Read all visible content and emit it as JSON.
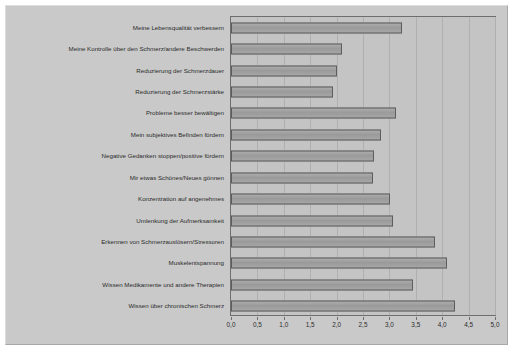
{
  "chart_data": {
    "type": "bar",
    "orientation": "horizontal",
    "title": "",
    "xlabel": "",
    "ylabel": "",
    "xlim": [
      0.0,
      5.0
    ],
    "xticks": [
      "0,0",
      "0,5",
      "1,0",
      "1,5",
      "2,0",
      "2,5",
      "3,0",
      "3,5",
      "4,0",
      "4,5",
      "5,0"
    ],
    "xtick_values": [
      0.0,
      0.5,
      1.0,
      1.5,
      2.0,
      2.5,
      3.0,
      3.5,
      4.0,
      4.5,
      5.0
    ],
    "grid": true,
    "legend": "none",
    "categories": [
      "Meine Lebensqualität verbessern",
      "Meine Kontrolle über den Schmerz/andere Beschwerden",
      "Reduzierung der Schmerzdauer",
      "Reduzierung der Schmerzstärke",
      "Probleme besser bewältigen",
      "Mein subjektives Befinden fördern",
      "Negative Gedanken stoppen/positive fördern",
      "Mir etwas Schönes/Neues gönnen",
      "Konzentration auf angenehmes",
      "Umlenkung der Aufmerksamkeit",
      "Erkennen von Schmerzauslösern/Stressoren",
      "Muskelentspannung",
      "Wissen Medikamente und andere Therapien",
      "Wissen über chronischen Schmerz"
    ],
    "values": [
      3.23,
      2.1,
      2.0,
      1.93,
      3.12,
      2.84,
      2.7,
      2.68,
      3.01,
      3.06,
      3.86,
      4.1,
      3.44,
      4.24
    ],
    "colors": {
      "bar_fill": "#a0a0a0",
      "bar_edge": "#5d5d5d",
      "plot_background": "#c4c4c4",
      "panel_background": "#c9c9c9",
      "grid": "#b0b0b0",
      "axis": "#6e6e6e",
      "text": "#2b2b2b"
    }
  }
}
